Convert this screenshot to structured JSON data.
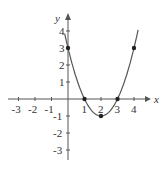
{
  "chart_data": {
    "type": "line",
    "title": "",
    "xlabel": "x",
    "ylabel": "y",
    "xlim": [
      -3,
      4
    ],
    "ylim": [
      -3,
      4
    ],
    "x_ticks": [
      -3,
      -2,
      -1,
      1,
      2,
      3,
      4
    ],
    "y_ticks": [
      -3,
      -2,
      -1,
      1,
      2,
      3,
      4
    ],
    "grid": false,
    "series": [
      {
        "name": "y = x^2 - 4x + 3",
        "x": [
          0,
          1,
          2,
          3,
          4
        ],
        "y": [
          3,
          0,
          -1,
          0,
          3
        ]
      }
    ],
    "points": [
      [
        0,
        3
      ],
      [
        1,
        0
      ],
      [
        2,
        -1
      ],
      [
        3,
        0
      ],
      [
        4,
        3
      ]
    ],
    "color": "#555555"
  }
}
